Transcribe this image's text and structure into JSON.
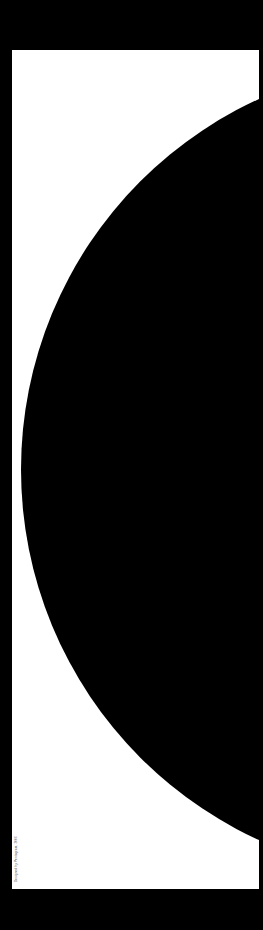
{
  "colors": {
    "background": "#000000",
    "panel": "#ffffff",
    "shape": "#000000",
    "caption": "#555555"
  },
  "poster": {
    "shape": "half-circle",
    "caption": "Designed by Pentagram, 2006"
  }
}
